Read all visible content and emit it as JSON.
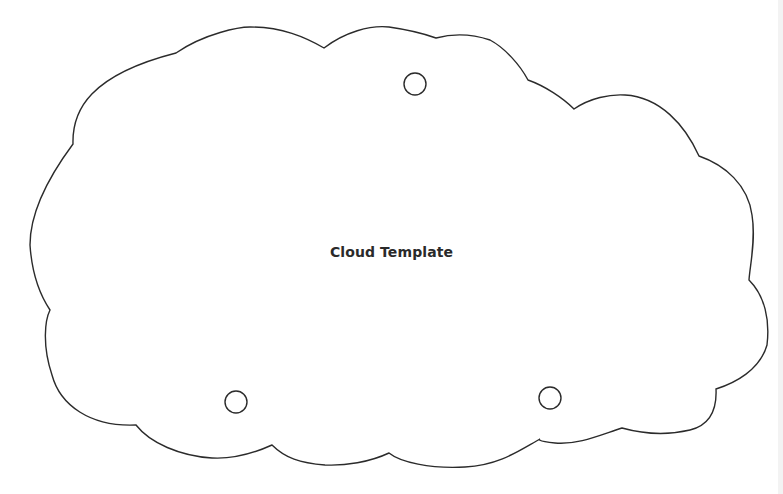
{
  "document": {
    "title": "Cloud Template"
  },
  "colors": {
    "outline": "#2b2b2b",
    "background": "#ffffff",
    "text": "#2a2a2a"
  },
  "shapes": {
    "cloud_outline": "cloud-shape",
    "holes": [
      {
        "name": "top-hole",
        "cx": 415,
        "cy": 84,
        "r": 11
      },
      {
        "name": "bottom-left-hole",
        "cx": 236,
        "cy": 402,
        "r": 11
      },
      {
        "name": "bottom-right-hole",
        "cx": 550,
        "cy": 398,
        "r": 11
      }
    ]
  }
}
